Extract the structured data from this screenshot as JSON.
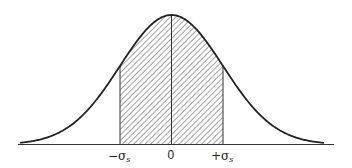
{
  "figure": {
    "type": "normal-distribution-diagram",
    "colors": {
      "curve": "#222222",
      "hatch": "#555555",
      "axis": "#333333",
      "background": "#ffffff"
    },
    "axis_labels": {
      "minus_sigma": "−σ",
      "minus_sigma_sub": "s",
      "zero": "0",
      "plus_sigma": "+σ",
      "plus_sigma_sub": "s"
    },
    "shaded_region": {
      "from": "-σs",
      "to": "+σs",
      "pattern": "diagonal-hatch"
    }
  }
}
